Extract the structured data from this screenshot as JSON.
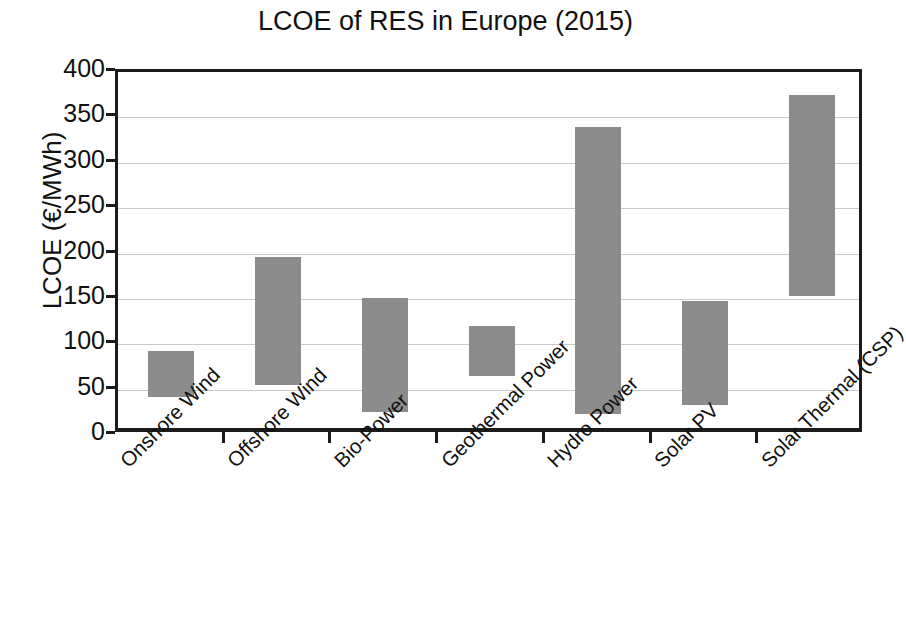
{
  "chart_data": {
    "type": "bar",
    "bar_style": "floating-range",
    "title": "LCOE of RES in Europe (2015)",
    "xlabel": "",
    "ylabel": "LCOE (€/MWh)",
    "ylim": [
      0,
      400
    ],
    "yticks": [
      0,
      50,
      100,
      150,
      200,
      250,
      300,
      350,
      400
    ],
    "ytick_labels": [
      "0",
      "50",
      "100",
      "150",
      "200",
      "250",
      "300",
      "350",
      "400"
    ],
    "grid": true,
    "grid_axis": "y",
    "legend": false,
    "bar_color": "#8c8c8c",
    "categories": [
      "Onshore Wind",
      "Offshore Wind",
      "Bio-Power",
      "Geothermal Power",
      "Hydro Power",
      "Solar PV",
      "Solar Thermal (CSP)"
    ],
    "series": [
      {
        "name": "LCOE low",
        "values": [
          42,
          55,
          25,
          65,
          23,
          33,
          153
        ]
      },
      {
        "name": "LCOE high",
        "values": [
          93,
          196,
          151,
          120,
          339,
          148,
          375
        ]
      }
    ],
    "ranges": [
      {
        "category": "Onshore Wind",
        "low": 42,
        "high": 93
      },
      {
        "category": "Offshore Wind",
        "low": 55,
        "high": 196
      },
      {
        "category": "Bio-Power",
        "low": 25,
        "high": 151
      },
      {
        "category": "Geothermal Power",
        "low": 65,
        "high": 120
      },
      {
        "category": "Hydro Power",
        "low": 23,
        "high": 339
      },
      {
        "category": "Solar PV",
        "low": 33,
        "high": 148
      },
      {
        "category": "Solar Thermal (CSP)",
        "low": 153,
        "high": 375
      }
    ]
  }
}
